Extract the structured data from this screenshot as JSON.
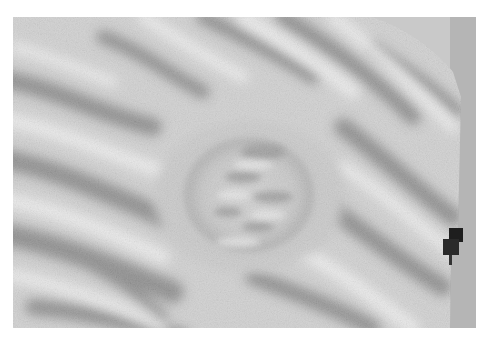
{
  "image": {
    "subject": "fossil slab with ripple marks and circular concretion",
    "palette": {
      "background": "#ffffff",
      "backdrop": "#c8c8c8",
      "rock_light": "#d8d8d8",
      "rock_mid": "#9a9a9a",
      "rock_dark": "#3a3a3a",
      "clamp": "#1e1e1e"
    }
  }
}
